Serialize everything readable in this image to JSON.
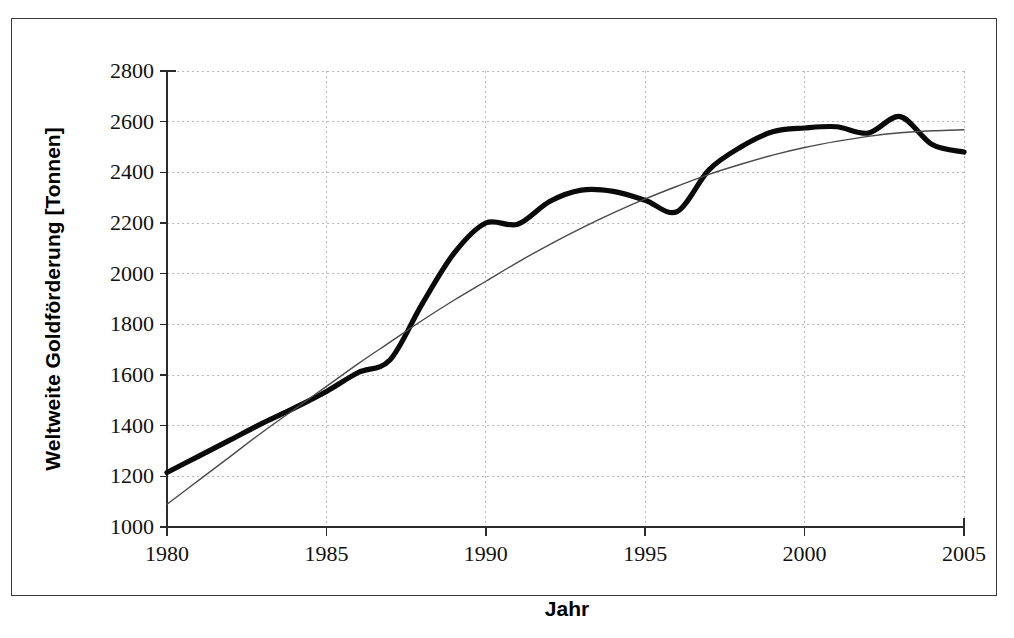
{
  "figure": {
    "background_color": "#ffffff",
    "frame_color": "#3a3a3a"
  },
  "chart_data": {
    "type": "line",
    "title": "",
    "xlabel": "Jahr",
    "ylabel": "Weltweite Goldförderung [Tonnen]",
    "xlim": [
      1980,
      2005
    ],
    "ylim": [
      1000,
      2800
    ],
    "xticks": [
      1980,
      1985,
      1990,
      1995,
      2000,
      2005
    ],
    "yticks": [
      1000,
      1200,
      1400,
      1600,
      1800,
      2000,
      2200,
      2400,
      2600,
      2800
    ],
    "xtick_labels": [
      "1980",
      "1985",
      "1990",
      "1995",
      "2000",
      "2005"
    ],
    "ytick_labels": [
      "1000",
      "1200",
      "1400",
      "1600",
      "1800",
      "2000",
      "2200",
      "2400",
      "2600",
      "2800"
    ],
    "grid": true,
    "grid_style": "dotted",
    "legend": "none",
    "x": [
      1980,
      1981,
      1982,
      1983,
      1984,
      1985,
      1986,
      1987,
      1988,
      1989,
      1990,
      1991,
      1992,
      1993,
      1994,
      1995,
      1996,
      1997,
      1998,
      1999,
      2000,
      2001,
      2002,
      2003,
      2004,
      2005
    ],
    "series": [
      {
        "name": "Weltweite Goldförderung",
        "style": "thick-solid",
        "color": "#0a0a0a",
        "values": [
          1215,
          1280,
          1345,
          1410,
          1470,
          1535,
          1610,
          1660,
          1880,
          2080,
          2200,
          2195,
          2285,
          2330,
          2325,
          2290,
          2245,
          2410,
          2500,
          2560,
          2575,
          2580,
          2555,
          2620,
          2510,
          2480
        ]
      },
      {
        "name": "Trendlinie (Ausgleichskurve)",
        "style": "thin-solid",
        "color": "#4a4a4a",
        "values": [
          1090,
          1185,
          1280,
          1375,
          1465,
          1555,
          1645,
          1730,
          1815,
          1895,
          1970,
          2045,
          2115,
          2180,
          2240,
          2295,
          2345,
          2392,
          2432,
          2468,
          2498,
          2522,
          2542,
          2556,
          2564,
          2568
        ]
      }
    ]
  }
}
